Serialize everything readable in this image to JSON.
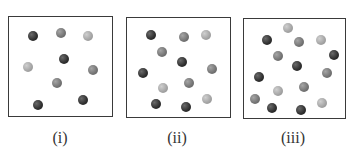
{
  "figure": {
    "panels": [
      {
        "label": "(i)",
        "box": {
          "left": 8,
          "top": 16,
          "width": 105,
          "height": 101
        },
        "label_x": 60,
        "spheres": [
          {
            "x": 33,
            "y": 36,
            "shade": "dark"
          },
          {
            "x": 61,
            "y": 33,
            "shade": "medium"
          },
          {
            "x": 88,
            "y": 36,
            "shade": "light"
          },
          {
            "x": 64,
            "y": 59,
            "shade": "dark"
          },
          {
            "x": 28,
            "y": 67,
            "shade": "light"
          },
          {
            "x": 93,
            "y": 70,
            "shade": "medium"
          },
          {
            "x": 57,
            "y": 83,
            "shade": "medium"
          },
          {
            "x": 38,
            "y": 105,
            "shade": "dark"
          },
          {
            "x": 83,
            "y": 100,
            "shade": "dark"
          }
        ]
      },
      {
        "label": "(ii)",
        "box": {
          "left": 126,
          "top": 17,
          "width": 105,
          "height": 101
        },
        "label_x": 177,
        "spheres": [
          {
            "x": 151,
            "y": 35,
            "shade": "dark"
          },
          {
            "x": 184,
            "y": 37,
            "shade": "medium"
          },
          {
            "x": 206,
            "y": 35,
            "shade": "light"
          },
          {
            "x": 162,
            "y": 52,
            "shade": "medium"
          },
          {
            "x": 182,
            "y": 62,
            "shade": "dark"
          },
          {
            "x": 212,
            "y": 69,
            "shade": "medium"
          },
          {
            "x": 143,
            "y": 73,
            "shade": "dark"
          },
          {
            "x": 189,
            "y": 83,
            "shade": "medium"
          },
          {
            "x": 163,
            "y": 88,
            "shade": "light"
          },
          {
            "x": 156,
            "y": 104,
            "shade": "dark"
          },
          {
            "x": 186,
            "y": 107,
            "shade": "dark"
          },
          {
            "x": 207,
            "y": 99,
            "shade": "light"
          }
        ]
      },
      {
        "label": "(iii)",
        "box": {
          "left": 243,
          "top": 18,
          "width": 103,
          "height": 101
        },
        "label_x": 293,
        "spheres": [
          {
            "x": 288,
            "y": 28,
            "shade": "light"
          },
          {
            "x": 267,
            "y": 40,
            "shade": "dark"
          },
          {
            "x": 299,
            "y": 42,
            "shade": "medium"
          },
          {
            "x": 321,
            "y": 40,
            "shade": "light"
          },
          {
            "x": 278,
            "y": 56,
            "shade": "medium"
          },
          {
            "x": 334,
            "y": 55,
            "shade": "dark"
          },
          {
            "x": 297,
            "y": 66,
            "shade": "dark"
          },
          {
            "x": 327,
            "y": 73,
            "shade": "medium"
          },
          {
            "x": 259,
            "y": 77,
            "shade": "dark"
          },
          {
            "x": 304,
            "y": 87,
            "shade": "medium"
          },
          {
            "x": 278,
            "y": 91,
            "shade": "light"
          },
          {
            "x": 255,
            "y": 99,
            "shade": "medium"
          },
          {
            "x": 322,
            "y": 103,
            "shade": "light"
          },
          {
            "x": 272,
            "y": 108,
            "shade": "dark"
          },
          {
            "x": 301,
            "y": 110,
            "shade": "dark"
          }
        ]
      }
    ],
    "colors": {
      "dark": "#2e2e2e",
      "medium": "#737373",
      "light": "#a3a3a3",
      "border": "#3a3a3a"
    }
  }
}
